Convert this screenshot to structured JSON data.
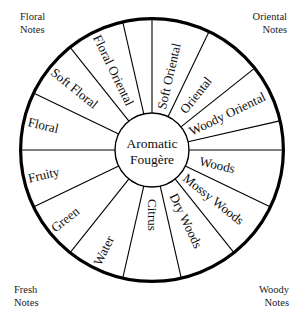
{
  "diagram": {
    "center_label_line1": "Aromatic",
    "center_label_line2": "Fougère",
    "stroke_color": "#000000",
    "background_color": "#ffffff",
    "text_color": "#0d0d0d"
  },
  "corner_notes": [
    {
      "id": "floral",
      "line1": "Floral",
      "line2": "Notes"
    },
    {
      "id": "oriental",
      "line1": "Oriental",
      "line2": "Notes"
    },
    {
      "id": "woody",
      "line1": "Woody",
      "line2": "Notes"
    },
    {
      "id": "fresh",
      "line1": "Fresh",
      "line2": "Notes"
    }
  ],
  "geometry": {
    "center_x": 152,
    "center_y": 150,
    "outer_radius": 133,
    "hub_radius": 37,
    "segment_count": 14
  },
  "segments": [
    {
      "index": 0,
      "label": "Soft Oriental",
      "family": "oriental",
      "start_deg": -90,
      "end_deg": -64.286
    },
    {
      "index": 1,
      "label": "Oriental",
      "family": "oriental",
      "start_deg": -64.286,
      "end_deg": -38.571
    },
    {
      "index": 2,
      "label": "Woody Oriental",
      "family": "oriental",
      "start_deg": -38.571,
      "end_deg": -12.857
    },
    {
      "index": 3,
      "label": "Woods",
      "family": "woody",
      "start_deg": 0,
      "end_deg": 25.714
    },
    {
      "index": 4,
      "label": "Mossy Woods",
      "family": "woody",
      "start_deg": 25.714,
      "end_deg": 51.429
    },
    {
      "index": 5,
      "label": "Dry Woods",
      "family": "woody",
      "start_deg": 51.429,
      "end_deg": 77.143
    },
    {
      "index": 6,
      "label": "Citrus",
      "family": "fresh",
      "start_deg": 77.143,
      "end_deg": 102.857
    },
    {
      "index": 7,
      "label": "Water",
      "family": "fresh",
      "start_deg": 102.857,
      "end_deg": 128.571
    },
    {
      "index": 8,
      "label": "Green",
      "family": "fresh",
      "start_deg": 128.571,
      "end_deg": 154.286
    },
    {
      "index": 9,
      "label": "Fruity",
      "family": "fresh",
      "start_deg": 154.286,
      "end_deg": 180
    },
    {
      "index": 10,
      "label": "Floral",
      "family": "floral",
      "start_deg": 180,
      "end_deg": 205.714
    },
    {
      "index": 11,
      "label": "Soft Floral",
      "family": "floral",
      "start_deg": 205.714,
      "end_deg": 231.429
    },
    {
      "index": 12,
      "label": "Floral Oriental",
      "family": "floral",
      "start_deg": 231.429,
      "end_deg": 257.143
    },
    {
      "index": 13,
      "label": "",
      "family": "floral",
      "start_deg": 257.143,
      "end_deg": 270
    }
  ]
}
